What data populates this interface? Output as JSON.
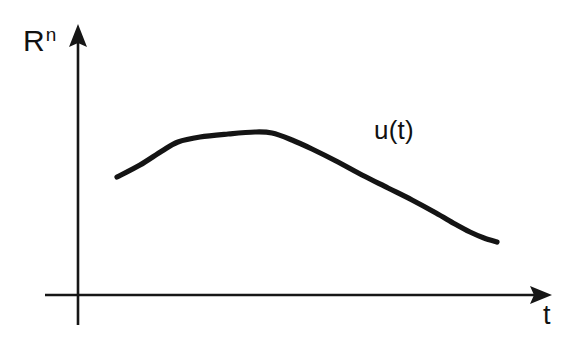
{
  "figure": {
    "background_color": "#ffffff",
    "ink_color": "#141414",
    "y_axis_label_base": "R",
    "y_axis_label_exponent": "n",
    "x_axis_label": "t",
    "curve_label": "u(t)"
  },
  "chart_data": {
    "type": "line",
    "title": "",
    "subtitle": "",
    "xlabel": "t",
    "ylabel": "R^n",
    "grid": false,
    "legend": "inline-annotation",
    "annotations": [
      {
        "text": "u(t)",
        "x": 400,
        "y": 133,
        "role": "curve-name"
      }
    ],
    "axes": {
      "x_origin_px": 78,
      "y_origin_px": 295,
      "x_axis_start_px": 45,
      "x_axis_end_px": 545,
      "y_axis_top_px": 28,
      "y_axis_bottom_px": 325,
      "x_arrow": true,
      "y_arrow": true,
      "tick_labels_x": [],
      "tick_labels_y": []
    },
    "series": [
      {
        "name": "u(t)",
        "stroke": "#141414",
        "points_px": [
          [
            117,
            177
          ],
          [
            140,
            165
          ],
          [
            162,
            151
          ],
          [
            178,
            142
          ],
          [
            200,
            137
          ],
          [
            228,
            134
          ],
          [
            255,
            132
          ],
          [
            272,
            133
          ],
          [
            292,
            140
          ],
          [
            312,
            149
          ],
          [
            338,
            162
          ],
          [
            362,
            175
          ],
          [
            388,
            188
          ],
          [
            412,
            200
          ],
          [
            436,
            213
          ],
          [
            455,
            224
          ],
          [
            470,
            232
          ],
          [
            484,
            238
          ],
          [
            497,
            242
          ]
        ]
      }
    ]
  }
}
